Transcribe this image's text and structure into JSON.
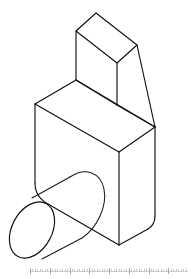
{
  "document": {
    "title": "Isometric Part View",
    "background_color": "#ffffff",
    "line_color": "#111111",
    "face_color": "#ffffff",
    "width_px": 191,
    "height_px": 279,
    "projection": "isometric",
    "view_label": ""
  },
  "drawing": {
    "name": "mechanical-part-isometric",
    "description": "Isometric line drawing of a machined block with a ramped upper boss and a cylindrical boss on the left front face",
    "stroke_width": 1.15,
    "features": [
      {
        "id": "main-block",
        "label": "Main rectangular block with rounded bottom corners"
      },
      {
        "id": "upper-ramp-block",
        "label": "Upper block with angled ramp face"
      },
      {
        "id": "cylindrical-boss",
        "label": "Cylindrical boss protruding from left front face"
      }
    ]
  },
  "geometry": {
    "main_block": {
      "top_face": "35,104 76,80 155,127 119,152",
      "left_front_vertical": "35,104 35,190",
      "center_front_vertical": "119,152 119,245",
      "right_vertical": "155,127 155,218",
      "left_face_path": "M35,104 L35,183 Q35,196 48,203 L119,245 L119,152 Z",
      "right_face_path": "M119,152 L119,245 L149,228 Q155,224 155,216 L155,127 Z"
    },
    "upper_block": {
      "top_face": "76,31 96,13 137,45 117,63",
      "left_vertical": "76,31 76,80",
      "front_lower_edge": "76,80 117,105",
      "ridge_to_apex": "117,63 155,127",
      "ramp_right_edge": "137,45 155,127",
      "ramp_inner_edge": "117,105 155,127"
    },
    "cylinder_boss": {
      "front_ellipse_center": "32,230",
      "front_ellipse_rx": 20,
      "front_ellipse_ry": 30,
      "front_ellipse_rotation_deg": 28,
      "back_ellipse_center": "68,207",
      "axis_direction": "up-right",
      "top_silhouette": "32,198 70,177",
      "bottom_silhouette": "42,259 82,238"
    }
  },
  "ruler": {
    "name": "bottom-scale-bar",
    "visible": true,
    "tick_count": 64,
    "major_every": 8,
    "color": "#c8c8c8"
  }
}
